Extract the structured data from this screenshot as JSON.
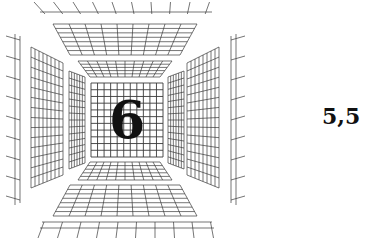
{
  "figure": {
    "center_number": "6",
    "side_label": "5,5",
    "colors": {
      "line": "#3a3a3a",
      "text": "#111111",
      "background": "#ffffff"
    },
    "panels": [
      {
        "id": "back-wall",
        "description": "central square grid panel"
      },
      {
        "id": "ceiling-inner",
        "description": "inner ceiling grid panel"
      },
      {
        "id": "ceiling-outer",
        "description": "outer ceiling grid panel"
      },
      {
        "id": "ceiling-far",
        "description": "outermost ceiling strip"
      },
      {
        "id": "floor-inner",
        "description": "inner floor grid panel"
      },
      {
        "id": "floor-outer",
        "description": "outer floor grid panel"
      },
      {
        "id": "floor-far",
        "description": "outermost floor strip"
      },
      {
        "id": "left-wall-inner",
        "description": "inner left wall grid panel"
      },
      {
        "id": "left-wall-outer",
        "description": "outer left wall grid panel"
      },
      {
        "id": "left-wall-far",
        "description": "outermost left wall strip"
      },
      {
        "id": "right-wall-inner",
        "description": "inner right wall grid panel"
      },
      {
        "id": "right-wall-outer",
        "description": "outer right wall grid panel"
      },
      {
        "id": "right-wall-far",
        "description": "outermost right wall strip"
      }
    ]
  }
}
